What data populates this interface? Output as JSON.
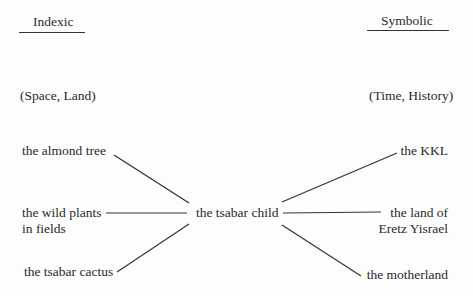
{
  "diagram": {
    "columns": {
      "left": {
        "heading": "Indexic",
        "subheading": "(Space, Land)"
      },
      "right": {
        "heading": "Symbolic",
        "subheading": "(Time, History)"
      }
    },
    "center_node": {
      "label": "the tsabar child"
    },
    "left_nodes": [
      {
        "label": "the almond tree"
      },
      {
        "label": "the wild plants",
        "label_line2": "in fields"
      },
      {
        "label": "the tsabar cactus"
      }
    ],
    "right_nodes": [
      {
        "label": "the KKL"
      },
      {
        "label": "the land of",
        "label_line2": "Eretz Yisrael"
      },
      {
        "label": "the motherland"
      }
    ],
    "edges": [
      {
        "from": "the almond tree",
        "to": "the tsabar child"
      },
      {
        "from": "the wild plants in fields",
        "to": "the tsabar child"
      },
      {
        "from": "the tsabar cactus",
        "to": "the tsabar child"
      },
      {
        "from": "the tsabar child",
        "to": "the KKL"
      },
      {
        "from": "the tsabar child",
        "to": "the land of Eretz Yisrael"
      },
      {
        "from": "the tsabar child",
        "to": "the motherland"
      }
    ]
  }
}
